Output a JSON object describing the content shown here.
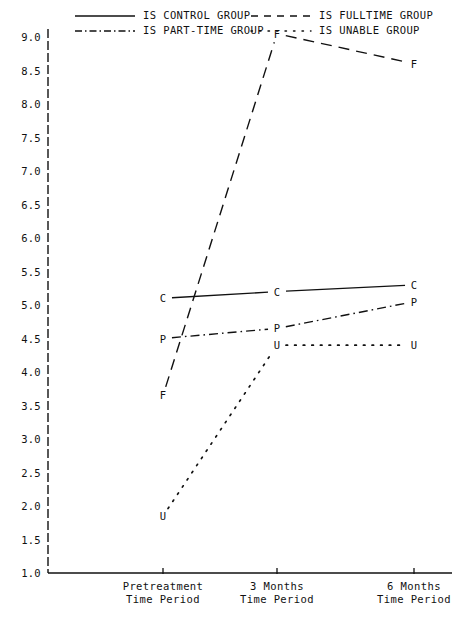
{
  "legend": {
    "entries": [
      {
        "label": "IS CONTROL GROUP",
        "style": "solid",
        "key": "C"
      },
      {
        "label": "IS FULLTIME GROUP",
        "style": "dashed",
        "key": "F"
      },
      {
        "label": "IS PART-TIME GROUP",
        "style": "dashdot",
        "key": "P"
      },
      {
        "label": "IS UNABLE GROUP",
        "style": "dotted",
        "key": "U"
      }
    ]
  },
  "axes": {
    "y_ticks": [
      "9.0",
      "8.5",
      "8.0",
      "7.5",
      "7.0",
      "6.5",
      "6.0",
      "5.5",
      "5.0",
      "4.5",
      "4.0",
      "3.5",
      "3.0",
      "2.5",
      "2.0",
      "1.5",
      "1.0"
    ],
    "x_ticks": [
      {
        "line1": "Pretreatment",
        "line2": "Time Period"
      },
      {
        "line1": "3 Months",
        "line2": "Time Period"
      },
      {
        "line1": "6 Months",
        "line2": "Time Period"
      }
    ]
  },
  "chart_data": {
    "type": "line",
    "title": "",
    "xlabel": "Time Period",
    "ylabel": "",
    "categories": [
      "Pretreatment",
      "3 Months",
      "6 Months"
    ],
    "ylim": [
      1.0,
      9.0
    ],
    "ytick_step": 0.5,
    "grid": false,
    "legend_position": "top",
    "point_markers": "letters",
    "series": [
      {
        "name": "IS CONTROL GROUP",
        "marker": "C",
        "style": "solid",
        "values": [
          5.1,
          5.2,
          5.3
        ]
      },
      {
        "name": "IS FULLTIME GROUP",
        "marker": "F",
        "style": "dashed",
        "values": [
          3.65,
          9.05,
          8.6
        ]
      },
      {
        "name": "IS PART-TIME GROUP",
        "marker": "P",
        "style": "dashdot",
        "values": [
          4.5,
          4.65,
          5.05
        ]
      },
      {
        "name": "IS UNABLE GROUP",
        "marker": "U",
        "style": "dotted",
        "values": [
          1.85,
          4.4,
          4.4
        ]
      }
    ]
  }
}
